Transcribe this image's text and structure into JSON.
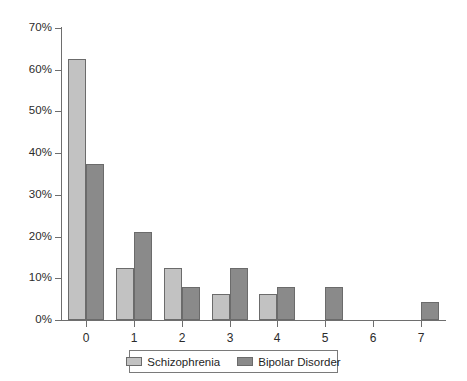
{
  "chart_data": {
    "type": "bar",
    "title": "",
    "subtitle": "",
    "xlabel": "",
    "ylabel": "",
    "categories": [
      "0",
      "1",
      "2",
      "3",
      "4",
      "5",
      "6",
      "7"
    ],
    "series": [
      {
        "name": "Schizophrenia",
        "color": "#c2c2c2",
        "values": [
          62.5,
          12.5,
          12.5,
          6.3,
          6.3,
          0,
          0,
          0
        ]
      },
      {
        "name": "Bipolar Disorder",
        "color": "#8a8a8a",
        "values": [
          37.5,
          21.0,
          8.0,
          12.5,
          8.0,
          8.0,
          0,
          4.2
        ]
      }
    ],
    "ylim": [
      0,
      70
    ],
    "y_tick_step": 10,
    "y_tick_labels": [
      "0%",
      "10%",
      "20%",
      "30%",
      "40%",
      "50%",
      "60%",
      "70%"
    ],
    "y_tick_values": [
      0,
      10,
      20,
      30,
      40,
      50,
      60,
      70
    ],
    "grid": false,
    "legend_position": "bottom",
    "axis_color": "#6e6e6e",
    "bar_border_color": "#6b6b6b",
    "background": "#ffffff"
  }
}
